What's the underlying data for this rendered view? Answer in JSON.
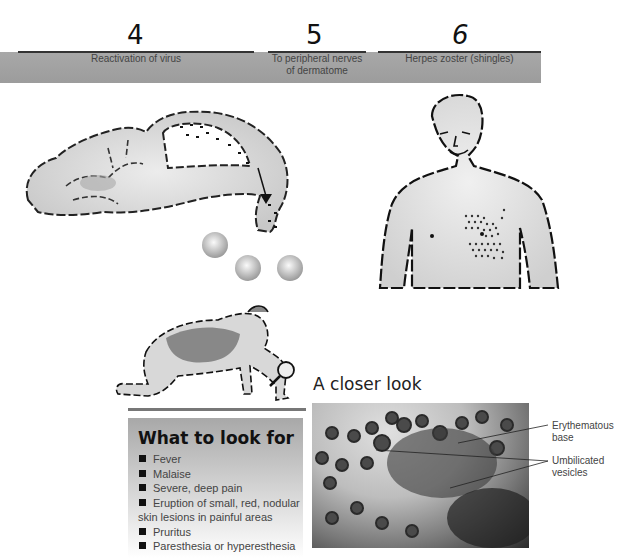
{
  "steps": [
    {
      "number": "4",
      "label": "Reactivation of virus"
    },
    {
      "number": "5",
      "label_line1": "To peripheral nerves",
      "label_line2": "of dermatome"
    },
    {
      "number": "6",
      "label": "Herpes zoster (shingles)"
    }
  ],
  "illustrations": {
    "brain": "brain-nerve-pathway-illustration",
    "torso": "man-torso-with-dermatome-rash",
    "examiner": "person-with-magnifying-glass"
  },
  "what_to_look_for": {
    "title": "What to look for",
    "items": [
      "Fever",
      "Malaise",
      "Severe, deep pain",
      "Eruption of small, red, nodular",
      "Pruritus",
      "Paresthesia or hyperesthesia"
    ],
    "item4_continuation": "skin lesions in painful areas"
  },
  "closer_look": {
    "title": "A closer look",
    "callouts": [
      {
        "line1": "Erythematous",
        "line2": "base"
      },
      {
        "line1": "Umbilicated",
        "line2": "vesicles"
      }
    ]
  },
  "colors": {
    "banner": "#a3a3a3",
    "panel_top": "#a8a8a8",
    "text": "#444444"
  }
}
